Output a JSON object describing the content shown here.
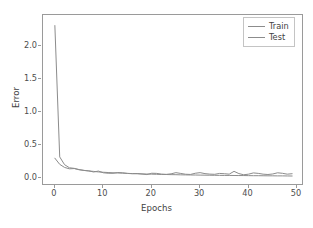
{
  "chart_data": {
    "type": "line",
    "title": "",
    "xlabel": "Epochs",
    "ylabel": "Error",
    "xlim": [
      -2.45,
      51.45
    ],
    "ylim": [
      -0.118,
      2.47
    ],
    "grid": false,
    "legend_position": "upper right",
    "xticks": [
      0,
      10,
      20,
      30,
      40,
      50
    ],
    "xtick_labels": [
      "0",
      "10",
      "20",
      "30",
      "40",
      "50"
    ],
    "yticks": [
      0.0,
      0.5,
      1.0,
      1.5,
      2.0
    ],
    "ytick_labels": [
      "0.0",
      "0.5",
      "1.0",
      "1.5",
      "2.0"
    ],
    "line_color": "#8c8c8c",
    "frame_color": "#9a9a9a",
    "background_color": "#ffffff",
    "x": [
      0,
      1,
      2,
      3,
      4,
      5,
      6,
      7,
      8,
      9,
      10,
      11,
      12,
      13,
      14,
      15,
      16,
      17,
      18,
      19,
      20,
      21,
      22,
      23,
      24,
      25,
      26,
      27,
      28,
      29,
      30,
      31,
      32,
      33,
      34,
      35,
      36,
      37,
      38,
      39,
      40,
      41,
      42,
      43,
      44,
      45,
      46,
      47,
      48,
      49
    ],
    "series": [
      {
        "name": "Train",
        "color": "#8c8c8c",
        "values": [
          2.31,
          0.322,
          0.205,
          0.158,
          0.149,
          0.131,
          0.118,
          0.109,
          0.103,
          0.095,
          0.09,
          0.086,
          0.082,
          0.079,
          0.076,
          0.073,
          0.07,
          0.067,
          0.065,
          0.063,
          0.061,
          0.059,
          0.057,
          0.056,
          0.054,
          0.053,
          0.051,
          0.05,
          0.049,
          0.048,
          0.047,
          0.046,
          0.045,
          0.044,
          0.043,
          0.042,
          0.042,
          0.041,
          0.04,
          0.04,
          0.039,
          0.038,
          0.038,
          0.037,
          0.036,
          0.036,
          0.035,
          0.035,
          0.034,
          0.033
        ]
      },
      {
        "name": "Test",
        "color": "#8c8c8c",
        "values": [
          0.303,
          0.21,
          0.163,
          0.142,
          0.146,
          0.128,
          0.118,
          0.112,
          0.094,
          0.108,
          0.082,
          0.075,
          0.074,
          0.086,
          0.082,
          0.072,
          0.068,
          0.071,
          0.063,
          0.055,
          0.075,
          0.073,
          0.062,
          0.058,
          0.066,
          0.084,
          0.072,
          0.06,
          0.057,
          0.075,
          0.084,
          0.069,
          0.062,
          0.059,
          0.072,
          0.068,
          0.061,
          0.104,
          0.07,
          0.052,
          0.061,
          0.08,
          0.073,
          0.061,
          0.056,
          0.064,
          0.082,
          0.074,
          0.061,
          0.068
        ]
      }
    ]
  }
}
